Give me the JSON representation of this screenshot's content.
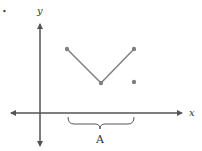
{
  "bullet": "•",
  "axes": {
    "x_label": "x",
    "y_label": "y",
    "color": "#555555"
  },
  "graph": {
    "line_color": "#808080",
    "point_color": "#808080",
    "segment_points": [
      [
        67,
        49
      ],
      [
        101,
        83
      ],
      [
        134,
        49
      ]
    ],
    "isolated_point": [
      134,
      82
    ]
  },
  "brace": {
    "label": "A",
    "x_start": 68,
    "x_end": 134
  }
}
